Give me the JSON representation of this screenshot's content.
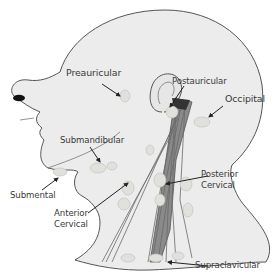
{
  "diagram": {
    "colors": {
      "background": "#ffffff",
      "skin_fill": "#ececec",
      "outline": "#555555",
      "node_fill": "#e0e0dc",
      "muscle": "#6a6a6a",
      "arrow": "#222222",
      "text": "#3a3a3a"
    },
    "labels": {
      "preauricular": "Preauricular",
      "postauricular": "Postauricular",
      "occipital": "Occipital",
      "submandibular": "Submandibular",
      "submental": "Submental",
      "posterior_cervical_line1": "Posterior",
      "posterior_cervical_line2": "Cervical",
      "anterior_cervical_line1": "Anterior",
      "anterior_cervical_line2": "Cervical",
      "supraclavicular": "Supraclavicular"
    }
  }
}
